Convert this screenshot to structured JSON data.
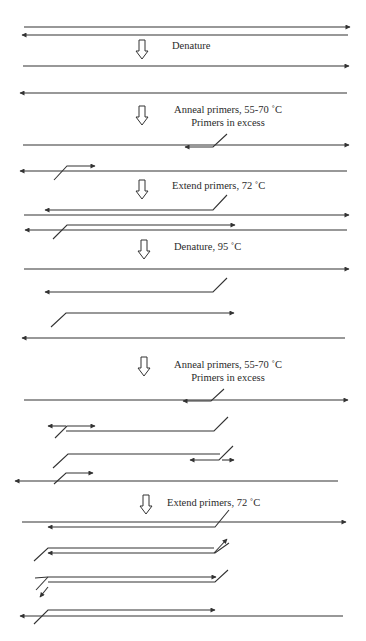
{
  "colors": {
    "line": "#333333",
    "text": "#2a2a2a",
    "background": "#ffffff"
  },
  "steps": [
    {
      "id": "denature-1",
      "arrow": {
        "x": 142,
        "y": 40
      },
      "lines": [
        {
          "text": "Denature",
          "x": 172,
          "y": 49,
          "anchor": "start"
        }
      ]
    },
    {
      "id": "anneal-1",
      "arrow": {
        "x": 142,
        "y": 106
      },
      "lines": [
        {
          "text": "Anneal primers, 55-70 ˚C",
          "x": 228,
          "y": 113,
          "anchor": "middle"
        },
        {
          "text": "Primers in excess",
          "x": 228,
          "y": 126,
          "anchor": "middle"
        }
      ]
    },
    {
      "id": "extend-1",
      "arrow": {
        "x": 142,
        "y": 180
      },
      "lines": [
        {
          "text": "Extend primers, 72 ˚C",
          "x": 172,
          "y": 189,
          "anchor": "start"
        }
      ]
    },
    {
      "id": "denature-2",
      "arrow": {
        "x": 144,
        "y": 240
      },
      "lines": [
        {
          "text": "Denature, 95 ˚C",
          "x": 174,
          "y": 250,
          "anchor": "start"
        }
      ]
    },
    {
      "id": "anneal-2",
      "arrow": {
        "x": 144,
        "y": 357
      },
      "lines": [
        {
          "text": "Anneal primers, 55-70 ˚C",
          "x": 228,
          "y": 368,
          "anchor": "middle"
        },
        {
          "text": "Primers in excess",
          "x": 228,
          "y": 381,
          "anchor": "middle"
        }
      ]
    },
    {
      "id": "extend-2",
      "arrow": {
        "x": 146,
        "y": 495
      },
      "lines": [
        {
          "text": "Extend primers, 72 ˚C",
          "x": 167,
          "y": 506,
          "anchor": "start"
        }
      ]
    }
  ],
  "strands": [
    {
      "name": "template-top-strand",
      "points": [
        [
          24,
          27
        ],
        [
          350,
          27
        ]
      ],
      "head": "end"
    },
    {
      "name": "template-bottom-strand",
      "points": [
        [
          348,
          35
        ],
        [
          22,
          35
        ]
      ],
      "head": "end"
    },
    {
      "name": "denatured-top-strand",
      "points": [
        [
          23,
          66
        ],
        [
          349,
          66
        ]
      ],
      "head": "end"
    },
    {
      "name": "denatured-bottom-strand",
      "points": [
        [
          347,
          93
        ],
        [
          20,
          93
        ]
      ],
      "head": "end"
    },
    {
      "name": "anneal1-top-strand",
      "points": [
        [
          23,
          145
        ],
        [
          349,
          145
        ]
      ],
      "head": "end"
    },
    {
      "name": "anneal1-primer-reverse",
      "points": [
        [
          227,
          134
        ],
        [
          213,
          147
        ],
        [
          185,
          147
        ]
      ],
      "head": "end"
    },
    {
      "name": "anneal1-bottom-strand",
      "points": [
        [
          347,
          171
        ],
        [
          20,
          171
        ]
      ],
      "head": "end"
    },
    {
      "name": "anneal1-primer-forward",
      "points": [
        [
          54,
          180
        ],
        [
          67,
          166
        ],
        [
          95,
          166
        ]
      ],
      "head": "end"
    },
    {
      "name": "extend1-new-reverse-strand",
      "points": [
        [
          227,
          195
        ],
        [
          213,
          210
        ],
        [
          45,
          210
        ]
      ],
      "head": "end"
    },
    {
      "name": "extend1-top-strand",
      "points": [
        [
          24,
          215
        ],
        [
          349,
          215
        ]
      ],
      "head": "end"
    },
    {
      "name": "extend1-new-forward-strand",
      "points": [
        [
          53,
          239
        ],
        [
          67,
          225
        ],
        [
          235,
          225
        ]
      ],
      "head": "end"
    },
    {
      "name": "extend1-bottom-strand",
      "points": [
        [
          347,
          230
        ],
        [
          25,
          230
        ]
      ],
      "head": "end"
    },
    {
      "name": "denature2-top-strand",
      "points": [
        [
          24,
          269
        ],
        [
          349,
          269
        ]
      ],
      "head": "end"
    },
    {
      "name": "denature2-new-reverse-strand",
      "points": [
        [
          227,
          278
        ],
        [
          213,
          292
        ],
        [
          45,
          292
        ]
      ],
      "head": "end"
    },
    {
      "name": "denature2-new-forward-strand",
      "points": [
        [
          51,
          327
        ],
        [
          66,
          313
        ],
        [
          234,
          313
        ]
      ],
      "head": "end"
    },
    {
      "name": "denature2-bottom-strand",
      "points": [
        [
          345,
          338
        ],
        [
          22,
          338
        ]
      ],
      "head": "end"
    },
    {
      "name": "anneal2-top-strand",
      "points": [
        [
          24,
          400
        ],
        [
          348,
          400
        ]
      ],
      "head": "end"
    },
    {
      "name": "anneal2-primer-reverse",
      "points": [
        [
          224,
          389
        ],
        [
          211,
          401
        ],
        [
          183,
          401
        ]
      ],
      "head": "end"
    },
    {
      "name": "anneal2-reverse-product",
      "points": [
        [
          228,
          417
        ],
        [
          214,
          431
        ],
        [
          66,
          431
        ]
      ],
      "head": "none"
    },
    {
      "name": "anneal2-primer-forward-on-product",
      "points": [
        [
          55,
          438
        ],
        [
          67,
          426
        ],
        [
          95,
          426
        ]
      ],
      "head": "end"
    },
    {
      "name": "anneal2-primer-reverse-on-product",
      "points": [
        [
          233,
          446
        ],
        [
          219,
          460
        ],
        [
          190,
          460
        ]
      ],
      "head": "end"
    },
    {
      "name": "anneal2-forward-product",
      "points": [
        [
          53,
          468
        ],
        [
          68,
          454
        ],
        [
          220,
          454
        ]
      ],
      "head": "none"
    },
    {
      "name": "anneal2-primer-forward",
      "points": [
        [
          54,
          484
        ],
        [
          66,
          473
        ],
        [
          93,
          473
        ]
      ],
      "head": "end"
    },
    {
      "name": "anneal2-bottom-strand",
      "points": [
        [
          338,
          481
        ],
        [
          15,
          481
        ]
      ],
      "head": "end"
    },
    {
      "name": "anneal2-extra-arrow-left",
      "points": [
        [
          66,
          426
        ],
        [
          48,
          426
        ]
      ],
      "head": "end"
    },
    {
      "name": "anneal2-extra-arrow-right",
      "points": [
        [
          222,
          460
        ],
        [
          234,
          460
        ]
      ],
      "head": "end"
    },
    {
      "name": "extend2-top-strand",
      "points": [
        [
          22,
          522
        ],
        [
          346,
          522
        ]
      ],
      "head": "end"
    },
    {
      "name": "extend2-new-reverse-strand",
      "points": [
        [
          229,
          510
        ],
        [
          215,
          527
        ],
        [
          48,
          527
        ]
      ],
      "head": "end"
    },
    {
      "name": "extend2-forward-product",
      "points": [
        [
          34,
          561
        ],
        [
          48,
          548
        ],
        [
          214,
          548
        ]
      ],
      "head": "none"
    },
    {
      "name": "extend2-forward-extension",
      "points": [
        [
          214,
          553
        ],
        [
          227,
          539
        ]
      ],
      "head": "end"
    },
    {
      "name": "extend2-reverse-on-product",
      "points": [
        [
          229,
          543
        ],
        [
          215,
          553
        ],
        [
          48,
          553
        ]
      ],
      "head": "end"
    },
    {
      "name": "extend2-reverse-product",
      "points": [
        [
          228,
          570
        ],
        [
          215,
          582
        ],
        [
          48,
          582
        ]
      ],
      "head": "none"
    },
    {
      "name": "extend2-reverse-extension",
      "points": [
        [
          48,
          577
        ],
        [
          36,
          590
        ]
      ],
      "head": "none"
    },
    {
      "name": "extend2-forward-on-product",
      "points": [
        [
          48,
          587
        ],
        [
          40,
          597
        ]
      ],
      "head": "end"
    },
    {
      "name": "extend2-forward-new",
      "points": [
        [
          35,
          578
        ],
        [
          48,
          577
        ],
        [
          216,
          577
        ]
      ],
      "head": "end"
    },
    {
      "name": "extend2-new-forward-strand",
      "points": [
        [
          34,
          624
        ],
        [
          48,
          610
        ],
        [
          215,
          610
        ]
      ],
      "head": "end"
    },
    {
      "name": "extend2-bottom-strand",
      "points": [
        [
          343,
          616
        ],
        [
          20,
          616
        ]
      ],
      "head": "end"
    }
  ]
}
